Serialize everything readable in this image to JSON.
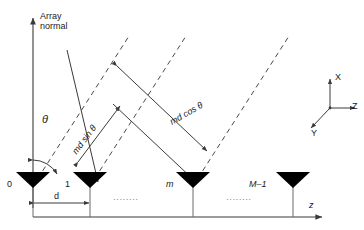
{
  "figure": {
    "type": "antenna-array-geometry-diagram",
    "axes": {
      "array_normal_label_line1": "Array",
      "array_normal_label_line2": "normal",
      "baseline_axis_label": "z"
    },
    "angle": {
      "theta_symbol": "θ"
    },
    "path_labels": {
      "sin_component": "md sin θ",
      "cos_component": "md cos θ"
    },
    "spacing": {
      "label": "d"
    },
    "elements": [
      {
        "index": 0,
        "label": "0",
        "x": 33
      },
      {
        "index": 1,
        "label": "1",
        "x": 90
      },
      {
        "index": 2,
        "label": "m",
        "x": 193
      },
      {
        "index": 3,
        "label": "M–1",
        "x": 293
      }
    ],
    "ellipsis": {
      "group_1": "· · · · · · · ·",
      "group_2": "· · · · · · · ·"
    },
    "coordinate_triad": {
      "x_label": "X",
      "y_label": "Y",
      "z_label": "Z"
    },
    "colors": {
      "stroke": "#3a3a3a",
      "element_fill": "#000000",
      "text": "#1a1a1a",
      "background": "#ffffff"
    }
  }
}
